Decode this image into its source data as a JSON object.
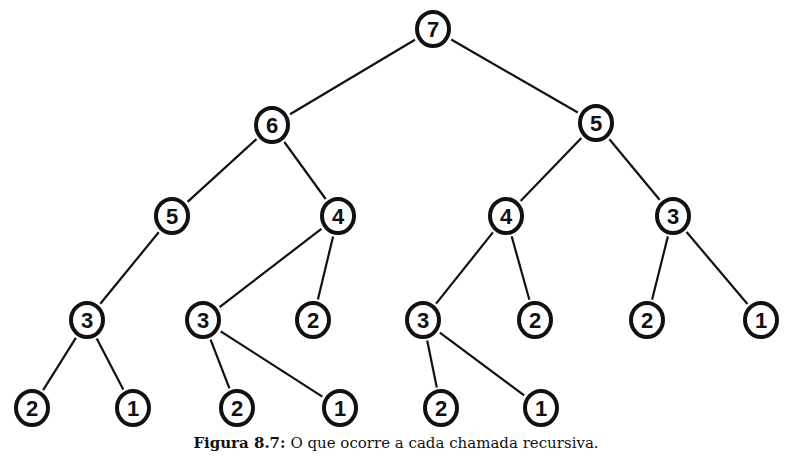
{
  "diagram": {
    "type": "tree",
    "nodes": [
      {
        "id": "n0",
        "label": "7",
        "x": 433,
        "y": 29
      },
      {
        "id": "n1",
        "label": "6",
        "x": 272,
        "y": 125
      },
      {
        "id": "n2",
        "label": "5",
        "x": 596,
        "y": 123
      },
      {
        "id": "n3",
        "label": "5",
        "x": 172,
        "y": 216
      },
      {
        "id": "n4",
        "label": "4",
        "x": 338,
        "y": 216
      },
      {
        "id": "n5",
        "label": "4",
        "x": 506,
        "y": 216
      },
      {
        "id": "n6",
        "label": "3",
        "x": 673,
        "y": 216
      },
      {
        "id": "n7",
        "label": "3",
        "x": 87,
        "y": 320
      },
      {
        "id": "n8",
        "label": "3",
        "x": 203,
        "y": 320
      },
      {
        "id": "n9",
        "label": "2",
        "x": 313,
        "y": 320
      },
      {
        "id": "n10",
        "label": "3",
        "x": 423,
        "y": 320
      },
      {
        "id": "n11",
        "label": "2",
        "x": 535,
        "y": 320
      },
      {
        "id": "n12",
        "label": "2",
        "x": 647,
        "y": 320
      },
      {
        "id": "n13",
        "label": "1",
        "x": 761,
        "y": 320
      },
      {
        "id": "n14",
        "label": "2",
        "x": 32,
        "y": 408
      },
      {
        "id": "n15",
        "label": "1",
        "x": 133,
        "y": 408
      },
      {
        "id": "n16",
        "label": "2",
        "x": 237,
        "y": 408
      },
      {
        "id": "n17",
        "label": "1",
        "x": 340,
        "y": 408
      },
      {
        "id": "n18",
        "label": "2",
        "x": 441,
        "y": 408
      },
      {
        "id": "n19",
        "label": "1",
        "x": 541,
        "y": 408
      }
    ],
    "edges": [
      [
        "n0",
        "n1"
      ],
      [
        "n0",
        "n2"
      ],
      [
        "n1",
        "n3"
      ],
      [
        "n1",
        "n4"
      ],
      [
        "n2",
        "n5"
      ],
      [
        "n2",
        "n6"
      ],
      [
        "n3",
        "n7"
      ],
      [
        "n4",
        "n8"
      ],
      [
        "n4",
        "n9"
      ],
      [
        "n5",
        "n10"
      ],
      [
        "n5",
        "n11"
      ],
      [
        "n6",
        "n12"
      ],
      [
        "n6",
        "n13"
      ],
      [
        "n7",
        "n14"
      ],
      [
        "n7",
        "n15"
      ],
      [
        "n8",
        "n16"
      ],
      [
        "n8",
        "n17"
      ],
      [
        "n10",
        "n18"
      ],
      [
        "n10",
        "n19"
      ]
    ],
    "node_radius": 16,
    "stroke_color": "#111111"
  },
  "caption": {
    "label": "Figura 8.7:",
    "text": " O que ocorre a cada chamada recursiva."
  }
}
